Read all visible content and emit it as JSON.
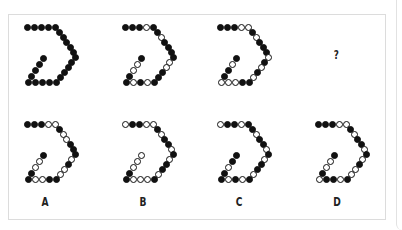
{
  "puzzle": {
    "question_mark": "?",
    "path_points": [
      [
        0,
        0
      ],
      [
        7,
        0
      ],
      [
        14,
        0
      ],
      [
        21,
        0
      ],
      [
        28,
        0
      ],
      [
        32,
        5
      ],
      [
        36,
        10
      ],
      [
        39,
        15
      ],
      [
        43,
        20
      ],
      [
        46,
        25
      ],
      [
        48,
        30
      ],
      [
        44,
        35
      ],
      [
        41,
        40
      ],
      [
        37,
        45
      ],
      [
        33,
        50
      ],
      [
        29,
        55
      ],
      [
        22,
        55
      ],
      [
        15,
        55
      ],
      [
        8,
        55
      ],
      [
        1,
        55
      ],
      [
        4,
        49
      ],
      [
        8,
        43
      ],
      [
        12,
        37
      ],
      [
        16,
        31
      ]
    ],
    "sequence": [
      {
        "id": "fig1",
        "fills": "111111111111111111111111"
      },
      {
        "id": "fig2",
        "fills": "111011011110011101011001"
      },
      {
        "id": "fig3",
        "fills": "111001011101010110001101"
      }
    ],
    "options": [
      {
        "label": "A",
        "fills": "111001001110100110011001"
      },
      {
        "label": "B",
        "fills": "011001011010110100011000"
      },
      {
        "label": "C",
        "fills": "011011011010110101011011"
      },
      {
        "label": "D",
        "fills": "111001011010100101101001"
      }
    ]
  }
}
